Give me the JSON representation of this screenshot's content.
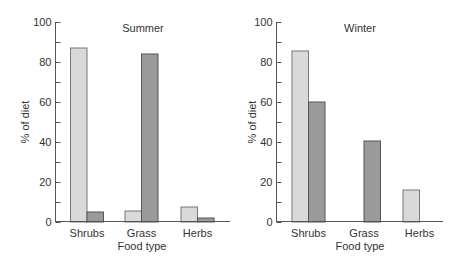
{
  "chart_data": [
    {
      "type": "bar",
      "title": "Summer",
      "xlabel": "Food type",
      "ylabel": "% of diet",
      "ylim": [
        0,
        100
      ],
      "yticks": [
        0,
        20,
        40,
        60,
        80,
        100
      ],
      "grid": false,
      "legend": null,
      "categories": [
        "Shrubs",
        "Grass",
        "Herbs"
      ],
      "series": [
        {
          "name": "light",
          "color": "#d9d9d9",
          "values": [
            87,
            5.5,
            7.5
          ]
        },
        {
          "name": "dark",
          "color": "#9a9a9a",
          "values": [
            5,
            84,
            2
          ]
        }
      ]
    },
    {
      "type": "bar",
      "title": "Winter",
      "xlabel": "Food type",
      "ylabel": "% of diet",
      "ylim": [
        0,
        100
      ],
      "yticks": [
        0,
        20,
        40,
        60,
        80,
        100
      ],
      "grid": false,
      "legend": null,
      "categories": [
        "Shrubs",
        "Grass",
        "Herbs"
      ],
      "series": [
        {
          "name": "light",
          "color": "#d9d9d9",
          "values": [
            85.5,
            0,
            16
          ]
        },
        {
          "name": "dark",
          "color": "#9a9a9a",
          "values": [
            60,
            40.5,
            0
          ]
        }
      ]
    }
  ]
}
